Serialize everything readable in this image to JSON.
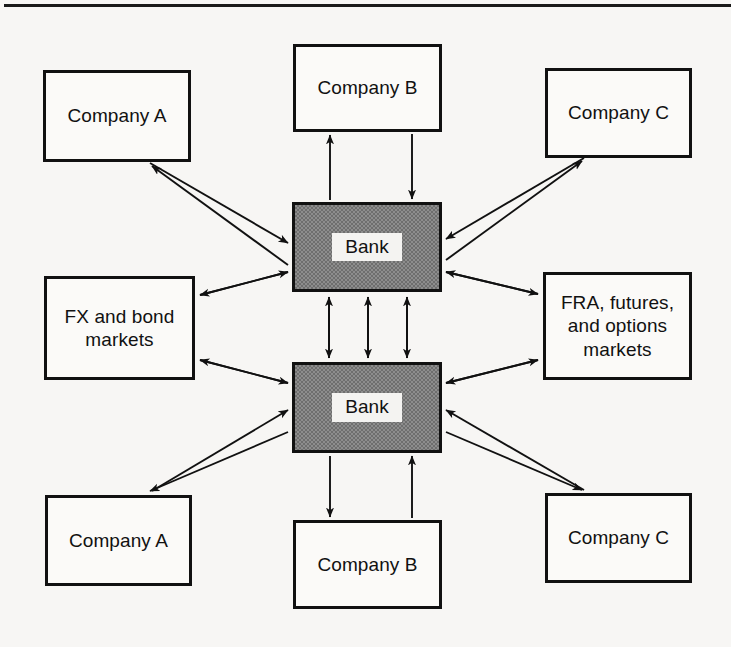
{
  "figure": {
    "frame": {
      "top_rule": true
    },
    "colors": {
      "background": "#f7f6f4",
      "node_fill": "#fbfaf8",
      "bank_fill": "#8d8d8d",
      "stroke": "#111111",
      "label_fill": "#f4f3f1"
    }
  },
  "nodes": {
    "company_a_top": {
      "label": "Company A",
      "x": 43,
      "y": 70,
      "w": 148,
      "h": 92
    },
    "company_b_top": {
      "label": "Company B",
      "x": 293,
      "y": 44,
      "w": 149,
      "h": 88
    },
    "company_c_top": {
      "label": "Company C",
      "x": 545,
      "y": 68,
      "w": 147,
      "h": 90
    },
    "fx_markets": {
      "label": "FX and bond\nmarkets",
      "x": 44,
      "y": 276,
      "w": 151,
      "h": 104
    },
    "bank_top": {
      "label": "Bank",
      "x": 292,
      "y": 202,
      "w": 150,
      "h": 90
    },
    "fra_markets": {
      "label": "FRA, futures,\nand options\nmarkets",
      "x": 543,
      "y": 272,
      "w": 149,
      "h": 108
    },
    "company_a_bottom": {
      "label": "Company A",
      "x": 45,
      "y": 495,
      "w": 147,
      "h": 91
    },
    "bank_bottom": {
      "label": "Bank",
      "x": 292,
      "y": 362,
      "w": 150,
      "h": 91
    },
    "company_b_bottom": {
      "label": "Company B",
      "x": 293,
      "y": 520,
      "w": 149,
      "h": 89
    },
    "company_c_bottom": {
      "label": "Company C",
      "x": 545,
      "y": 493,
      "w": 147,
      "h": 90
    }
  },
  "edges": [
    {
      "name": "company-a-top-to-bank-top",
      "from": "company_a_top",
      "to": "bank_top",
      "style": "single-arrow"
    },
    {
      "name": "bank-top-to-company-a-top",
      "from": "bank_top",
      "to": "company_a_top",
      "style": "single-arrow"
    },
    {
      "name": "company-b-top-to-bank-top",
      "from": "company_b_top",
      "to": "bank_top",
      "style": "single-arrow"
    },
    {
      "name": "bank-top-to-company-b-top",
      "from": "bank_top",
      "to": "company_b_top",
      "style": "single-arrow"
    },
    {
      "name": "company-c-top-to-bank-top",
      "from": "company_c_top",
      "to": "bank_top",
      "style": "single-arrow"
    },
    {
      "name": "bank-top-to-company-c-top",
      "from": "bank_top",
      "to": "company_c_top",
      "style": "single-arrow"
    },
    {
      "name": "fx-markets-bank-top",
      "from": "fx_markets",
      "to": "bank_top",
      "style": "double-arrow"
    },
    {
      "name": "fx-markets-bank-bottom",
      "from": "fx_markets",
      "to": "bank_bottom",
      "style": "double-arrow"
    },
    {
      "name": "fra-markets-bank-top",
      "from": "fra_markets",
      "to": "bank_top",
      "style": "double-arrow"
    },
    {
      "name": "fra-markets-bank-bottom",
      "from": "fra_markets",
      "to": "bank_bottom",
      "style": "double-arrow"
    },
    {
      "name": "interbank-link-1",
      "from": "bank_top",
      "to": "bank_bottom",
      "style": "double-arrow"
    },
    {
      "name": "interbank-link-2",
      "from": "bank_top",
      "to": "bank_bottom",
      "style": "double-arrow"
    },
    {
      "name": "interbank-link-3",
      "from": "bank_top",
      "to": "bank_bottom",
      "style": "double-arrow"
    },
    {
      "name": "company-a-bottom-to-bank-bottom",
      "from": "company_a_bottom",
      "to": "bank_bottom",
      "style": "single-arrow"
    },
    {
      "name": "bank-bottom-to-company-a-bottom",
      "from": "bank_bottom",
      "to": "company_a_bottom",
      "style": "single-arrow"
    },
    {
      "name": "bank-bottom-to-company-b-bottom",
      "from": "bank_bottom",
      "to": "company_b_bottom",
      "style": "single-arrow"
    },
    {
      "name": "company-b-bottom-to-bank-bottom",
      "from": "company_b_bottom",
      "to": "bank_bottom",
      "style": "single-arrow"
    },
    {
      "name": "company-c-bottom-to-bank-bottom",
      "from": "company_c_bottom",
      "to": "bank_bottom",
      "style": "single-arrow"
    },
    {
      "name": "bank-bottom-to-company-c-bottom",
      "from": "bank_bottom",
      "to": "company_c_bottom",
      "style": "single-arrow"
    }
  ]
}
